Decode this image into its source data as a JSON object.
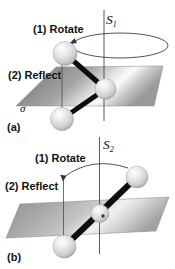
{
  "panel_a": {
    "label": "(a)",
    "axis_symbol": "S",
    "axis_subscript": "1",
    "step1_label": "(1) Rotate",
    "step2_label": "(2) Reflect",
    "plane_symbol": "σ"
  },
  "panel_b": {
    "label": "(b)",
    "axis_symbol": "S",
    "axis_subscript": "2",
    "step1_label": "(1) Rotate",
    "step2_label": "(2) Reflect"
  },
  "colors": {
    "background": "#ffffff",
    "rod": "#0d0d0d",
    "thin_line": "#4a4a4a",
    "text": "#111111",
    "plane_dark": "#8e8e8e",
    "plane_highlight": "#fbfbfb"
  }
}
